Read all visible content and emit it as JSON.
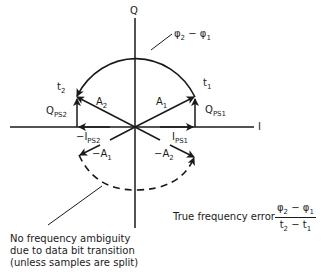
{
  "axes": {
    "q_label": "Q",
    "i_label": "I"
  },
  "phase_annotation": {
    "phi2": "φ",
    "phi2_sub": "2",
    "minus": " − ",
    "phi1": "φ",
    "phi1_sub": "1"
  },
  "points": {
    "t1": "t",
    "t1_sub": "1",
    "t2": "t",
    "t2_sub": "2"
  },
  "vectors": {
    "a1": "A",
    "a1_sub": "1",
    "a2": "A",
    "a2_sub": "2",
    "neg_a1": "−A",
    "neg_a1_sub": "1",
    "neg_a2": "−A",
    "neg_a2_sub": "2",
    "q_ps1": "Q",
    "q_ps1_sub": "PS1",
    "q_ps2": "Q",
    "q_ps2_sub": "PS2",
    "i_ps1": "I",
    "i_ps1_sub": "PS1",
    "neg_i_ps2": "−I",
    "neg_i_ps2_sub": "PS2"
  },
  "notes": {
    "ambiguity_line1": "No frequency ambiguity",
    "ambiguity_line2": "due to data bit transition",
    "ambiguity_line3": "(unless samples are split)",
    "freq_error_label": "True frequency error"
  },
  "formula": {
    "num_phi2": "φ",
    "num_phi2_sub": "2",
    "num_minus": " − ",
    "num_phi1": "φ",
    "num_phi1_sub": "1",
    "den_t2": "t",
    "den_t2_sub": "2",
    "den_minus": " − ",
    "den_t1": "t",
    "den_t1_sub": "1"
  },
  "colors": {
    "stroke": "#1a1a1a",
    "background": "#ffffff"
  }
}
